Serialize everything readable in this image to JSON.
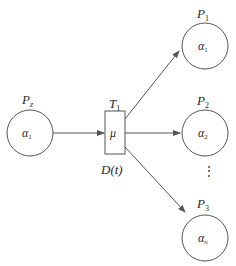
{
  "diagram": {
    "type": "petri-net",
    "source_place": {
      "label": "P",
      "label_sub": "z",
      "token": "α",
      "token_sub": "1"
    },
    "transition": {
      "label": "T",
      "label_sub": "1",
      "rate": "μ",
      "delay": "D(t)"
    },
    "output_places": [
      {
        "label": "P",
        "label_sub": "1",
        "token": "α",
        "token_sub": "1"
      },
      {
        "label": "P",
        "label_sub": "2",
        "token": "α",
        "token_sub": "2"
      },
      {
        "label": "P",
        "label_sub": "3",
        "token": "α",
        "token_sub": "n"
      }
    ],
    "ellipsis": "⋮",
    "colors": {
      "stroke": "#555555",
      "text": "#2a2a2a"
    }
  }
}
